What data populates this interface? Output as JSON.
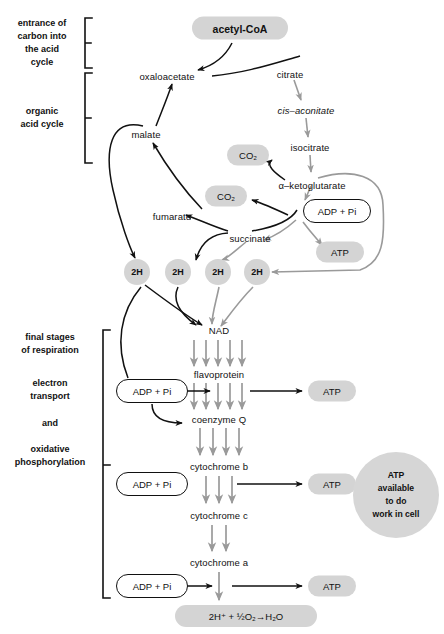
{
  "diagram": {
    "colors": {
      "pill_gray": "#d4d4d4",
      "ink": "#111111",
      "gray_arrow": "#9a9a9a",
      "black_arrow": "#111111"
    }
  },
  "side_labels": [
    {
      "id": "entrance",
      "text": "entrance of\ncarbon into\nthe acid\ncycle"
    },
    {
      "id": "organic",
      "text": "organic\nacid cycle"
    },
    {
      "id": "final",
      "text": "final stages\nof respiration"
    },
    {
      "id": "electron",
      "text": "electron\ntransport"
    },
    {
      "id": "and",
      "text": "and"
    },
    {
      "id": "oxidative",
      "text": "oxidative\nphosphorylation"
    }
  ],
  "nodes": {
    "acetyl_coa": "acetyl-CoA",
    "oxaloacetate": "oxaloacetate",
    "citrate": "citrate",
    "cis_aconitate": "cis–aconitate",
    "isocitrate": "isocitrate",
    "alpha_ketoglutarate": "α–ketoglutarate",
    "malate": "malate",
    "fumarate": "fumarate",
    "succinate": "succinate",
    "nad": "NAD",
    "flavoprotein": "flavoprotein",
    "coenzyme_q": "coenzyme Q",
    "cytochrome_b": "cytochrome b",
    "cytochrome_c": "cytochrome c",
    "cytochrome_a": "cytochrome a"
  },
  "pills": {
    "co2_1": "CO₂",
    "co2_2": "CO₂",
    "atp_cycle": "ATP",
    "atp_flavo": "ATP",
    "atp_cytb": "ATP",
    "atp_cyta": "ATP",
    "water": "2H⁺  +  ½O₂→H₂O"
  },
  "adp_boxes": {
    "adp_cycle": "ADP + Pi",
    "adp_flavo": "ADP + Pi",
    "adp_cytb": "ADP + Pi",
    "adp_cyta": "ADP + Pi"
  },
  "hydrogen_carriers": [
    {
      "label": "2H"
    },
    {
      "label": "2H"
    },
    {
      "label": "2H"
    },
    {
      "label": "2H"
    }
  ],
  "atp_pool": {
    "text": "ATP\navailable\nto do\nwork in cell"
  }
}
